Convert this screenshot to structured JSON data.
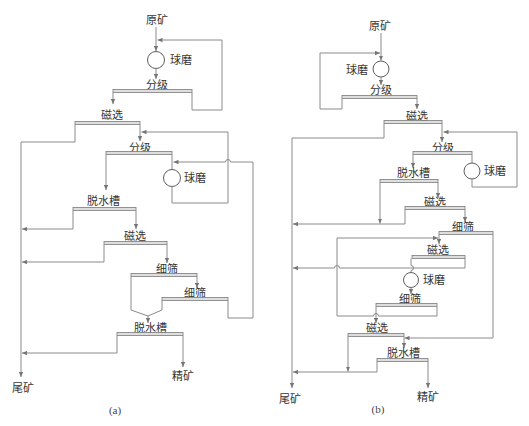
{
  "figure": {
    "panels": [
      {
        "caption": "(a)",
        "labels": {
          "feed": "原矿",
          "ball_mill_1": "球磨",
          "classification_1": "分级",
          "magnetic_separation_1": "磁选",
          "classification_2": "分级",
          "ball_mill_2": "球磨",
          "dewatering_tank_1": "脱水槽",
          "magnetic_separation_2": "磁选",
          "fine_screen_1": "细筛",
          "fine_screen_2": "细筛",
          "dewatering_tank_2": "脱水槽",
          "tailings": "尾矿",
          "concentrate": "精矿"
        },
        "flows": [
          {
            "from": "feed",
            "to": "ball_mill_1"
          },
          {
            "from": "ball_mill_1",
            "to": "classification_1"
          },
          {
            "from": "classification_1",
            "to": "magnetic_separation_1"
          },
          {
            "from": "classification_1",
            "to": "ball_mill_1"
          },
          {
            "from": "magnetic_separation_1",
            "to": "tailings"
          },
          {
            "from": "magnetic_separation_1",
            "to": "classification_2"
          },
          {
            "from": "classification_2",
            "to": "dewatering_tank_1"
          },
          {
            "from": "classification_2",
            "to": "ball_mill_2"
          },
          {
            "from": "ball_mill_2",
            "to": "classification_2"
          },
          {
            "from": "dewatering_tank_1",
            "to": "tailings"
          },
          {
            "from": "dewatering_tank_1",
            "to": "magnetic_separation_2"
          },
          {
            "from": "magnetic_separation_2",
            "to": "tailings"
          },
          {
            "from": "magnetic_separation_2",
            "to": "fine_screen_1"
          },
          {
            "from": "fine_screen_1",
            "to": "fine_screen_2"
          },
          {
            "from": "fine_screen_1",
            "to": "dewatering_tank_2"
          },
          {
            "from": "fine_screen_2",
            "to": "dewatering_tank_2"
          },
          {
            "from": "fine_screen_2",
            "to": "ball_mill_2"
          },
          {
            "from": "dewatering_tank_2",
            "to": "tailings"
          },
          {
            "from": "dewatering_tank_2",
            "to": "concentrate"
          }
        ]
      },
      {
        "caption": "(b)",
        "labels": {
          "feed": "原矿",
          "ball_mill_1": "球磨",
          "classification_1": "分级",
          "magnetic_separation_1": "磁选",
          "classification_2": "分级",
          "ball_mill_2": "球磨",
          "dewatering_tank_1": "脱水槽",
          "magnetic_separation_2": "磁选",
          "fine_screen_1": "细筛",
          "magnetic_separation_3": "磁选",
          "ball_mill_3": "球磨",
          "fine_screen_2": "细筛",
          "magnetic_separation_4": "磁选",
          "dewatering_tank_2": "脱水槽",
          "tailings": "尾矿",
          "concentrate": "精矿"
        },
        "flows": [
          {
            "from": "feed",
            "to": "ball_mill_1"
          },
          {
            "from": "ball_mill_1",
            "to": "classification_1"
          },
          {
            "from": "classification_1",
            "to": "ball_mill_1"
          },
          {
            "from": "classification_1",
            "to": "magnetic_separation_1"
          },
          {
            "from": "magnetic_separation_1",
            "to": "tailings"
          },
          {
            "from": "magnetic_separation_1",
            "to": "classification_2"
          },
          {
            "from": "classification_2",
            "to": "dewatering_tank_1"
          },
          {
            "from": "classification_2",
            "to": "ball_mill_2"
          },
          {
            "from": "ball_mill_2",
            "to": "classification_2"
          },
          {
            "from": "dewatering_tank_1",
            "to": "tailings"
          },
          {
            "from": "dewatering_tank_1",
            "to": "magnetic_separation_2"
          },
          {
            "from": "magnetic_separation_2",
            "to": "tailings"
          },
          {
            "from": "magnetic_separation_2",
            "to": "fine_screen_1"
          },
          {
            "from": "fine_screen_1",
            "to": "magnetic_separation_3"
          },
          {
            "from": "fine_screen_1",
            "to": "dewatering_tank_2"
          },
          {
            "from": "magnetic_separation_3",
            "to": "ball_mill_3"
          },
          {
            "from": "magnetic_separation_3",
            "to": "tailings"
          },
          {
            "from": "ball_mill_3",
            "to": "fine_screen_2"
          },
          {
            "from": "fine_screen_2",
            "to": "magnetic_separation_4"
          },
          {
            "from": "fine_screen_2",
            "to": "magnetic_separation_3"
          },
          {
            "from": "magnetic_separation_4",
            "to": "tailings"
          },
          {
            "from": "magnetic_separation_4",
            "to": "dewatering_tank_2"
          },
          {
            "from": "dewatering_tank_2",
            "to": "tailings"
          },
          {
            "from": "dewatering_tank_2",
            "to": "concentrate"
          }
        ]
      }
    ]
  },
  "colors": {
    "background": "#ffffff",
    "line": "#8a8a8a",
    "text": "#333333",
    "bar_fill": "#dedede"
  }
}
